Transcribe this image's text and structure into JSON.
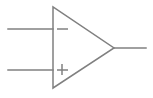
{
  "figure": {
    "background_color": "#ffffff",
    "stroke_color": "#808080",
    "stroke_width": 1.5,
    "width": 153,
    "height": 98
  },
  "component": {
    "name": "operational-amplifier",
    "body_shape": "triangle",
    "triangle_points": "53,7 53,88 114,48",
    "vertices": {
      "top_left": {
        "x": 53,
        "y": 7
      },
      "bottom_left": {
        "x": 53,
        "y": 88
      },
      "apex_right": {
        "x": 114,
        "y": 48
      }
    }
  },
  "terminals": {
    "inverting_input": {
      "label": "-",
      "polarity": "negative",
      "lead": {
        "x1": 8,
        "y1": 29,
        "x2": 53,
        "y2": 29
      },
      "mark": {
        "x1": 57,
        "y1": 29,
        "x2": 68,
        "y2": 29
      }
    },
    "noninverting_input": {
      "label": "+",
      "polarity": "positive",
      "lead": {
        "x1": 8,
        "y1": 70,
        "x2": 53,
        "y2": 70
      },
      "mark_horizontal": {
        "x1": 57,
        "y1": 70,
        "x2": 68,
        "y2": 70
      },
      "mark_vertical": {
        "x1": 62,
        "y1": 64,
        "x2": 62,
        "y2": 75
      }
    },
    "output": {
      "label": "out",
      "lead": {
        "x1": 114,
        "y1": 48,
        "x2": 146,
        "y2": 48
      }
    }
  }
}
